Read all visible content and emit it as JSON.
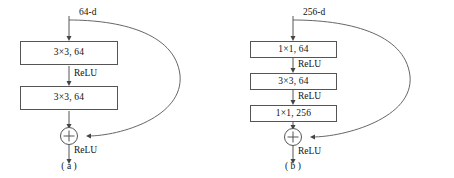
{
  "figure": {
    "panels": [
      {
        "id": "a",
        "caption": "( a )",
        "input_label": "64-d",
        "blocks": [
          {
            "label": "3×3, 64"
          },
          {
            "label": "3×3, 64"
          }
        ],
        "activations": [
          {
            "label": "ReLU"
          },
          {
            "label": "ReLU"
          }
        ],
        "junction": {
          "symbol": "+"
        }
      },
      {
        "id": "b",
        "caption": "( b )",
        "input_label": "256-d",
        "blocks": [
          {
            "label": "1×1, 64"
          },
          {
            "label": "3×3, 64"
          },
          {
            "label": "1×1, 256"
          }
        ],
        "activations": [
          {
            "label": "ReLU"
          },
          {
            "label": "ReLU"
          },
          {
            "label": "ReLU"
          }
        ],
        "junction": {
          "symbol": "+"
        }
      }
    ],
    "colors": {
      "stroke": "#555555",
      "skip_stroke": "#666666",
      "text": "#111111",
      "background": "#ffffff"
    }
  }
}
